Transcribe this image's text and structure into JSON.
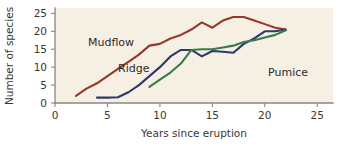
{
  "chart_data": {
    "type": "line",
    "title": "",
    "xlabel": "Years since eruption",
    "ylabel": "Number of species",
    "xlim": [
      0,
      26.5
    ],
    "ylim": [
      0,
      26.5
    ],
    "xticks": [
      0,
      5,
      10,
      15,
      20,
      25
    ],
    "yticks": [
      0,
      5,
      10,
      15,
      20,
      25
    ],
    "xtick_labels": [
      "0",
      "5",
      "10",
      "15",
      "20",
      "25"
    ],
    "ytick_labels": [
      "0",
      "5",
      "10",
      "15",
      "20",
      "25"
    ],
    "grid": false,
    "legend_position": "inline-annotations",
    "plot_background": "#f6efe4",
    "figure_background": "#ffffff",
    "series": [
      {
        "name": "Mudflow",
        "color": "#96382a",
        "label_x": 88,
        "label_y": 46,
        "x": [
          2,
          3,
          4,
          5,
          6,
          7,
          8,
          9,
          10,
          11,
          12,
          13,
          14,
          15,
          16,
          17,
          18,
          19,
          20,
          21,
          22
        ],
        "y": [
          2,
          4,
          5.5,
          7.5,
          9.5,
          11.5,
          13.5,
          16,
          16.5,
          18,
          19,
          20.5,
          22.5,
          21,
          23,
          24,
          24,
          23,
          22,
          21,
          20.5
        ]
      },
      {
        "name": "Ridge",
        "color": "#2c3a69",
        "label_x": 118,
        "label_y": 72,
        "x": [
          4,
          5,
          6,
          7,
          8,
          9,
          10,
          11,
          12,
          13,
          14,
          15,
          16,
          17,
          18,
          19,
          20,
          21,
          22
        ],
        "y": [
          1.5,
          1.5,
          1.6,
          3,
          5,
          7.5,
          10,
          13,
          14.8,
          14.8,
          13,
          14.5,
          14.3,
          14,
          16.5,
          18,
          20,
          20,
          20.5
        ]
      },
      {
        "name": "Pumice",
        "color": "#3a7a4a",
        "label_x": 268,
        "label_y": 76,
        "x": [
          9,
          10,
          11,
          12,
          13,
          14,
          15,
          16,
          17,
          18,
          19,
          20,
          21,
          22
        ],
        "y": [
          4.5,
          6.5,
          8.5,
          11,
          14.8,
          15,
          15,
          15.5,
          16,
          17,
          17.5,
          18.3,
          19,
          20.3
        ]
      }
    ]
  },
  "axes": {
    "x_title": "Years since eruption",
    "y_title": "Number of species"
  }
}
